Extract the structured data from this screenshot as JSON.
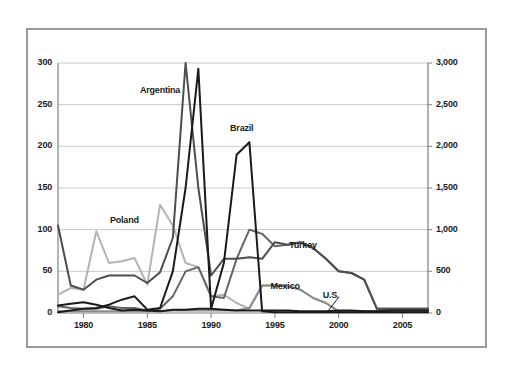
{
  "chart_data": {
    "type": "line",
    "title": "",
    "xlabel": "",
    "ylabel": "",
    "y2label": "",
    "xlim": [
      1978,
      2007
    ],
    "ylim": [
      0,
      300
    ],
    "y2lim": [
      0,
      3000
    ],
    "grid": true,
    "legend_position": "inline-annotations",
    "x": [
      1978,
      1979,
      1980,
      1981,
      1982,
      1983,
      1984,
      1985,
      1986,
      1987,
      1988,
      1989,
      1990,
      1991,
      1992,
      1993,
      1994,
      1995,
      1996,
      1997,
      1998,
      1999,
      2000,
      2001,
      2002,
      2003,
      2004,
      2005,
      2006,
      2007
    ],
    "xticks": [
      "1980",
      "1985",
      "1990",
      "1995",
      "2000",
      "2005"
    ],
    "xtick_values": [
      1980,
      1985,
      1990,
      1995,
      2000,
      2005
    ],
    "yticks": [
      "0",
      "50",
      "100",
      "150",
      "200",
      "250",
      "300"
    ],
    "ytick_values": [
      0,
      50,
      100,
      150,
      200,
      250,
      300
    ],
    "y2ticks": [
      "0",
      "500",
      "1,000",
      "1,500",
      "2,000",
      "2,500",
      "3,000"
    ],
    "y2tick_values": [
      0,
      500,
      1000,
      1500,
      2000,
      2500,
      3000
    ],
    "series": [
      {
        "name": "Argentina",
        "color": "#4d4d4d",
        "axis": "left",
        "label_x": 1986.0,
        "label_y": 268,
        "values": [
          105,
          33,
          28,
          40,
          45,
          45,
          45,
          36,
          49,
          90,
          300,
          150,
          45,
          65,
          65,
          67,
          65,
          85,
          82,
          85,
          78,
          65,
          50,
          48,
          40,
          5,
          5,
          5,
          5,
          5
        ]
      },
      {
        "name": "Brazil",
        "color": "#1a1a1a",
        "axis": "left",
        "label_x": 1992.4,
        "label_y": 222,
        "values": [
          1,
          3,
          5,
          6,
          10,
          16,
          20,
          4,
          6,
          50,
          150,
          293,
          5,
          60,
          190,
          205,
          2,
          1,
          1,
          1,
          1,
          1,
          1,
          1,
          1,
          1,
          1,
          1,
          1,
          1
        ]
      },
      {
        "name": "Poland",
        "color": "#b3b3b3",
        "axis": "left",
        "label_x": 1983.2,
        "label_y": 112,
        "values": [
          22,
          30,
          28,
          98,
          60,
          62,
          66,
          34,
          130,
          105,
          60,
          55,
          20,
          22,
          12,
          5,
          33,
          33,
          32,
          28,
          18,
          12,
          2,
          2,
          2,
          2,
          2,
          2,
          2,
          2
        ]
      },
      {
        "name": "Turkey",
        "color": "#666666",
        "axis": "left",
        "label_x": 1997.2,
        "label_y": 82,
        "values": [
          8,
          6,
          5,
          5,
          8,
          6,
          6,
          3,
          5,
          20,
          50,
          55,
          20,
          18,
          65,
          100,
          95,
          80,
          82,
          85,
          78,
          65,
          50,
          48,
          40,
          5,
          5,
          5,
          5,
          5
        ]
      },
      {
        "name": "Mexico",
        "color": "#8c8c8c",
        "axis": "left",
        "label_x": 1995.8,
        "label_y": 33,
        "values": [
          2,
          2,
          2,
          2,
          2,
          2,
          2,
          2,
          2,
          3,
          3,
          3,
          3,
          3,
          3,
          6,
          33,
          33,
          32,
          28,
          18,
          12,
          2,
          2,
          2,
          2,
          2,
          2,
          2,
          2
        ]
      },
      {
        "name": "U.S.",
        "color": "#1a1a1a",
        "axis": "left",
        "label_x": 1999.4,
        "label_y": 22,
        "values": [
          9,
          11,
          13,
          10,
          6,
          3,
          4,
          3,
          2,
          4,
          4,
          5,
          5,
          4,
          3,
          3,
          3,
          3,
          3,
          2,
          2,
          2,
          3,
          3,
          2,
          2,
          3,
          3,
          3,
          3
        ]
      }
    ],
    "annotations": [
      {
        "text": "Argentina",
        "x": 1986.0,
        "y": 268
      },
      {
        "text": "Brazil",
        "x": 1992.4,
        "y": 222
      },
      {
        "text": "Poland",
        "x": 1983.2,
        "y": 112
      },
      {
        "text": "Turkey",
        "x": 1997.2,
        "y": 82
      },
      {
        "text": "Mexico",
        "x": 1995.8,
        "y": 33
      },
      {
        "text": "U.S.",
        "x": 1999.4,
        "y": 22
      }
    ],
    "leader_lines": [
      {
        "from_x": 2000.0,
        "from_y": 19,
        "to_x": 1999.2,
        "to_y": 3
      }
    ]
  },
  "style": {
    "frame_color": "#9a9a9a",
    "grid_color": "#c8c8c8",
    "axis_color": "#808080",
    "text_color": "#1a1a1a",
    "background": "#ffffff"
  }
}
